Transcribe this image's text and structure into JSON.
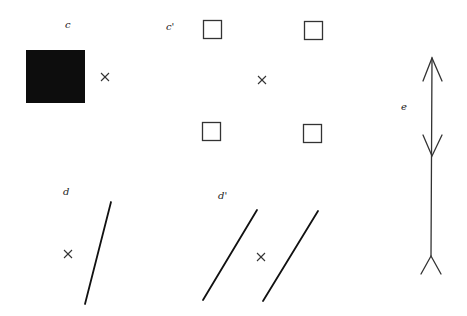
{
  "figure": {
    "labels": {
      "c": "c",
      "c_prime": "c'",
      "d": "d",
      "d_prime": "d'",
      "e": "e"
    },
    "colors": {
      "ink": "#111111",
      "stroke": "#333333",
      "background": "#ffffff"
    },
    "panels": [
      {
        "id": "c",
        "description": "filled black square with a cross mark to its right"
      },
      {
        "id": "c_prime",
        "description": "four small outlined squares arranged at corners around a central cross mark"
      },
      {
        "id": "d",
        "description": "single slanted line with a cross mark to its left"
      },
      {
        "id": "d_prime",
        "description": "two parallel slanted lines with a cross mark between them"
      },
      {
        "id": "e",
        "description": "vertical line with arrowhead at top, a downward chevron in the middle, and a forked tail at bottom"
      }
    ]
  }
}
